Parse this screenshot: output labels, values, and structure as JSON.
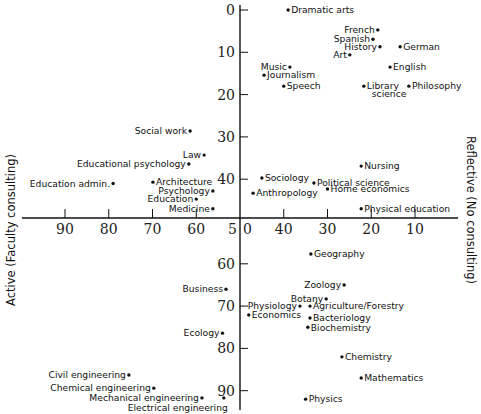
{
  "chart_data": {
    "type": "scatter",
    "title": "",
    "xlabel_left": "Active (Faculty consulting)",
    "ylabel_right": "Reflective (No consulting)",
    "x_axis": {
      "ticks": [
        90,
        80,
        70,
        60,
        50,
        40,
        30,
        20,
        10
      ],
      "reversed": true,
      "range": [
        95,
        0
      ]
    },
    "y_axis": {
      "ticks": [
        0,
        10,
        20,
        30,
        40,
        50,
        60,
        70,
        80,
        90
      ],
      "reversed": true,
      "range": [
        -1,
        94
      ]
    },
    "axis_cross": {
      "x": 50,
      "y": 50
    },
    "origin_labels": {
      "x_axis_50": "5",
      "y_axis_50": "0"
    },
    "grid": false,
    "legend": null,
    "points": [
      {
        "label": "Dramatic arts",
        "x": 39,
        "y": 0,
        "side": "right"
      },
      {
        "label": "French",
        "x": 18.5,
        "y": 4.7,
        "side": "left"
      },
      {
        "label": "Spanish",
        "x": 19.6,
        "y": 6.9,
        "side": "left"
      },
      {
        "label": "History",
        "x": 18,
        "y": 8.7,
        "side": "left"
      },
      {
        "label": "German",
        "x": 13.4,
        "y": 8.7,
        "side": "right"
      },
      {
        "label": "Art",
        "x": 24.9,
        "y": 10.6,
        "side": "left"
      },
      {
        "label": "English",
        "x": 15.7,
        "y": 13.5,
        "side": "right"
      },
      {
        "label": "Music",
        "x": 38.6,
        "y": 13.5,
        "side": "left"
      },
      {
        "label": "Journalism",
        "x": 44.5,
        "y": 15.4,
        "side": "right"
      },
      {
        "label": "Speech",
        "x": 40,
        "y": 18,
        "side": "right"
      },
      {
        "label": "Library",
        "label2": "science",
        "x": 21.7,
        "y": 18,
        "side": "right"
      },
      {
        "label": "Philosophy",
        "x": 11.4,
        "y": 18,
        "side": "right"
      },
      {
        "label": "Social work",
        "x": 61.4,
        "y": 28.6,
        "side": "left"
      },
      {
        "label": "Law",
        "x": 58.2,
        "y": 34.3,
        "side": "left"
      },
      {
        "label": "Educational psychology",
        "x": 61.7,
        "y": 36.4,
        "side": "left"
      },
      {
        "label": "Education admin.",
        "x": 79,
        "y": 41,
        "side": "left"
      },
      {
        "label": "Architecture",
        "x": 69.9,
        "y": 40.7,
        "side": "right"
      },
      {
        "label": "Psychology",
        "x": 56.2,
        "y": 42.8,
        "side": "left"
      },
      {
        "label": "Education",
        "x": 60,
        "y": 44.7,
        "side": "left"
      },
      {
        "label": "Medicine",
        "x": 56.2,
        "y": 47,
        "side": "left"
      },
      {
        "label": "Nursing",
        "x": 22.3,
        "y": 36.9,
        "side": "right"
      },
      {
        "label": "Sociology",
        "x": 45,
        "y": 39.7,
        "side": "right"
      },
      {
        "label": "Political science",
        "x": 33.1,
        "y": 40.9,
        "side": "right"
      },
      {
        "label": "Home economics",
        "x": 30,
        "y": 42.3,
        "side": "right"
      },
      {
        "label": "Anthropology",
        "x": 47,
        "y": 43.3,
        "side": "right"
      },
      {
        "label": "Physical education",
        "x": 22.3,
        "y": 47,
        "side": "right"
      },
      {
        "label": "Geography",
        "x": 33.8,
        "y": 57.7,
        "side": "right"
      },
      {
        "label": "Zoology",
        "x": 26.2,
        "y": 65,
        "side": "left"
      },
      {
        "label": "Business",
        "x": 53.2,
        "y": 66,
        "side": "left"
      },
      {
        "label": "Botany",
        "x": 30.3,
        "y": 68.3,
        "side": "left"
      },
      {
        "label": "Physiology",
        "x": 36.3,
        "y": 70,
        "side": "left"
      },
      {
        "label": "Agriculture/Forestry",
        "x": 34,
        "y": 70,
        "side": "right"
      },
      {
        "label": "Economics",
        "x": 48,
        "y": 72.1,
        "side": "right"
      },
      {
        "label": "Bacteriology",
        "x": 34,
        "y": 72.8,
        "side": "right"
      },
      {
        "label": "Biochemistry",
        "x": 34.5,
        "y": 75,
        "side": "right"
      },
      {
        "label": "Ecology",
        "x": 54,
        "y": 76.4,
        "side": "left"
      },
      {
        "label": "Chemistry",
        "x": 26.7,
        "y": 82,
        "side": "right"
      },
      {
        "label": "Mathematics",
        "x": 22.3,
        "y": 87,
        "side": "right"
      },
      {
        "label": "Physics",
        "x": 35,
        "y": 92,
        "side": "right"
      },
      {
        "label": "Civil engineering",
        "x": 75.4,
        "y": 86.3,
        "side": "left"
      },
      {
        "label": "Chemical engineering",
        "x": 69.7,
        "y": 89.4,
        "side": "left"
      },
      {
        "label": "Mechanical engineering",
        "x": 58.7,
        "y": 91.7,
        "side": "left"
      },
      {
        "label": "Electrical engineering",
        "x": 53.7,
        "y": 91.7,
        "side": "below-left"
      }
    ]
  }
}
